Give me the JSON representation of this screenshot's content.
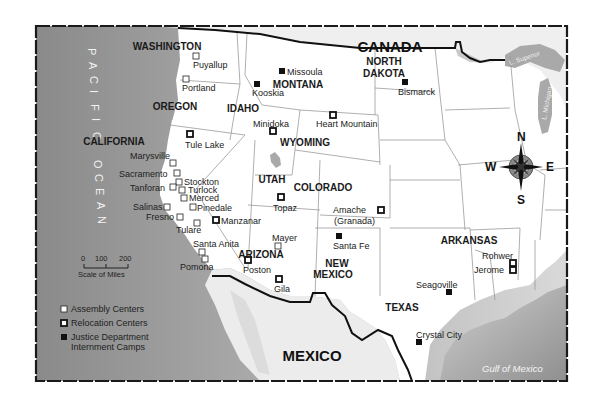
{
  "map": {
    "colors": {
      "land": "#ffffff",
      "ocean_dark": "#8c8c8c",
      "ocean_light": "#d8d8d8",
      "border": "#1a1a1a",
      "state_line": "#9a9a9a",
      "lake": "#a8a8a8",
      "mexico_land": "#eeeeee"
    },
    "countries": [
      {
        "id": "canada",
        "label": "CANADA",
        "x": 390,
        "y": 52
      },
      {
        "id": "mexico",
        "label": "MEXICO",
        "x": 312,
        "y": 361
      }
    ],
    "water_labels": {
      "ocean": [
        "P",
        "A",
        "C",
        "I",
        "F",
        "I",
        "C",
        " ",
        "O",
        "C",
        "E",
        "A",
        "N"
      ],
      "gulf": "Gulf of Mexico",
      "lake_superior": "L. Superior",
      "lake_michigan": "L. Michigan"
    },
    "states": [
      {
        "label": "WASHINGTON",
        "x": 167,
        "y": 50
      },
      {
        "label": "OREGON",
        "x": 175,
        "y": 110
      },
      {
        "label": "CALIFORNIA",
        "x": 114,
        "y": 145
      },
      {
        "label": "IDAHO",
        "x": 243,
        "y": 112
      },
      {
        "label": "MONTANA",
        "x": 298,
        "y": 88
      },
      {
        "label": "NORTH",
        "x": 384,
        "y": 65
      },
      {
        "label": "DAKOTA",
        "x": 384,
        "y": 77
      },
      {
        "label": "WYOMING",
        "x": 305,
        "y": 146
      },
      {
        "label": "UTAH",
        "x": 272,
        "y": 183
      },
      {
        "label": "COLORADO",
        "x": 323,
        "y": 191
      },
      {
        "label": "ARIZONA",
        "x": 261,
        "y": 258
      },
      {
        "label": "NEW",
        "x": 337,
        "y": 267
      },
      {
        "label": "MEXICO",
        "x": 333,
        "y": 278
      },
      {
        "label": "ARKANSAS",
        "x": 469,
        "y": 244
      },
      {
        "label": "TEXAS",
        "x": 402,
        "y": 311
      }
    ],
    "sites": [
      {
        "name": "Puyallup",
        "type": "assembly",
        "mx": 196,
        "my": 56,
        "lx": 193,
        "ly": 68
      },
      {
        "name": "Portland",
        "type": "assembly",
        "mx": 186,
        "my": 79,
        "lx": 182,
        "ly": 91
      },
      {
        "name": "Missoula",
        "type": "justice",
        "mx": 282,
        "my": 71,
        "lx": 287,
        "ly": 75
      },
      {
        "name": "Kooskia",
        "type": "justice",
        "mx": 257,
        "my": 84,
        "lx": 252,
        "ly": 96
      },
      {
        "name": "Bismarck",
        "type": "justice",
        "mx": 405,
        "my": 82,
        "lx": 398,
        "ly": 95
      },
      {
        "name": "Minidoka",
        "type": "relocation",
        "mx": 273,
        "my": 131,
        "lx": 253,
        "ly": 127
      },
      {
        "name": "Heart Mountain",
        "type": "relocation",
        "mx": 333,
        "my": 115,
        "lx": 316,
        "ly": 127
      },
      {
        "name": "Tule Lake",
        "type": "relocation",
        "mx": 190,
        "my": 134,
        "lx": 185,
        "ly": 148
      },
      {
        "name": "Marysville",
        "type": "assembly",
        "mx": 173,
        "my": 163,
        "lx": 130,
        "ly": 159
      },
      {
        "name": "Sacramento",
        "type": "assembly",
        "mx": 177,
        "my": 173,
        "lx": 119,
        "ly": 177
      },
      {
        "name": "Stockton",
        "type": "assembly",
        "mx": 179,
        "my": 182,
        "lx": 184,
        "ly": 185
      },
      {
        "name": "Tanforan",
        "type": "assembly",
        "mx": 173,
        "my": 187,
        "lx": 130,
        "ly": 191
      },
      {
        "name": "Turlock",
        "type": "assembly",
        "mx": 182,
        "my": 190,
        "lx": 188,
        "ly": 193
      },
      {
        "name": "Merced",
        "type": "assembly",
        "mx": 184,
        "my": 198,
        "lx": 189,
        "ly": 201
      },
      {
        "name": "Salinas",
        "type": "assembly",
        "mx": 167,
        "my": 207,
        "lx": 133,
        "ly": 210
      },
      {
        "name": "Pinedale",
        "type": "assembly",
        "mx": 193,
        "my": 207,
        "lx": 197,
        "ly": 211
      },
      {
        "name": "Fresno",
        "type": "assembly",
        "mx": 180,
        "my": 217,
        "lx": 146,
        "ly": 220
      },
      {
        "name": "Manzanar",
        "type": "relocation",
        "mx": 216,
        "my": 220,
        "lx": 221,
        "ly": 224
      },
      {
        "name": "Tulare",
        "type": "assembly",
        "mx": 197,
        "my": 223,
        "lx": 176,
        "ly": 233
      },
      {
        "name": "Santa Anita",
        "type": "assembly",
        "mx": 202,
        "my": 252,
        "lx": 193,
        "ly": 247
      },
      {
        "name": "Pomona",
        "type": "assembly",
        "mx": 205,
        "my": 259,
        "lx": 180,
        "ly": 270
      },
      {
        "name": "Poston",
        "type": "relocation",
        "mx": 248,
        "my": 260,
        "lx": 243,
        "ly": 273
      },
      {
        "name": "Topaz",
        "type": "relocation",
        "mx": 281,
        "my": 197,
        "lx": 273,
        "ly": 211
      },
      {
        "name": "Mayer",
        "type": "assembly",
        "mx": 278,
        "my": 246,
        "lx": 272,
        "ly": 241
      },
      {
        "name": "Gila",
        "type": "relocation",
        "mx": 279,
        "my": 279,
        "lx": 274,
        "ly": 292
      },
      {
        "name": "Santa Fe",
        "type": "justice",
        "mx": 339,
        "my": 236,
        "lx": 333,
        "ly": 249
      },
      {
        "name": "Amache",
        "type": "relocation",
        "mx": 381,
        "my": 210,
        "lx": 333,
        "ly": 213
      },
      {
        "name": "(Granada)",
        "type": "label_only",
        "mx": 0,
        "my": 0,
        "lx": 334,
        "ly": 224
      },
      {
        "name": "Rohwer",
        "type": "relocation",
        "mx": 513,
        "my": 263,
        "lx": 482,
        "ly": 259
      },
      {
        "name": "Jerome",
        "type": "relocation",
        "mx": 513,
        "my": 270,
        "lx": 474,
        "ly": 273
      },
      {
        "name": "Seagoville",
        "type": "justice",
        "mx": 449,
        "my": 292,
        "lx": 416,
        "ly": 288
      },
      {
        "name": "Crystal City",
        "type": "justice",
        "mx": 419,
        "my": 342,
        "lx": 416,
        "ly": 338
      }
    ],
    "legend": {
      "items": [
        {
          "type": "assembly",
          "label": "Assembly Centers"
        },
        {
          "type": "relocation",
          "label": "Relocation Centers"
        },
        {
          "type": "justice",
          "label": "Justice Department",
          "label2": "Internment Camps"
        }
      ]
    },
    "scale": {
      "ticks": [
        "0",
        "100",
        "200"
      ],
      "caption": "Scale of Miles"
    },
    "compass": {
      "n": "N",
      "s": "S",
      "e": "E",
      "w": "W"
    }
  }
}
